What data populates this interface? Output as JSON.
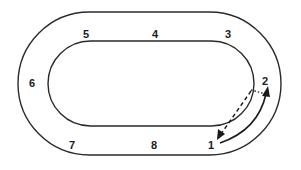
{
  "diagram": {
    "type": "oval-track",
    "colors": {
      "line": "#2a2a2a",
      "background": "#ffffff"
    },
    "track": {
      "outer": {
        "x": 18,
        "y": 12,
        "width": 263,
        "height": 143
      },
      "inner": {
        "x": 48,
        "y": 41,
        "width": 206,
        "height": 85
      }
    },
    "positions": [
      {
        "id": "1",
        "label": "1",
        "x": 208,
        "y": 149
      },
      {
        "id": "2",
        "label": "2",
        "x": 262,
        "y": 85
      },
      {
        "id": "3",
        "label": "3",
        "x": 225,
        "y": 38
      },
      {
        "id": "4",
        "label": "4",
        "x": 152,
        "y": 38
      },
      {
        "id": "5",
        "label": "5",
        "x": 83,
        "y": 38
      },
      {
        "id": "6",
        "label": "6",
        "x": 29,
        "y": 87
      },
      {
        "id": "7",
        "label": "7",
        "x": 69,
        "y": 149
      },
      {
        "id": "8",
        "label": "8",
        "x": 151,
        "y": 149
      }
    ],
    "arrows": [
      {
        "name": "solid-arrow",
        "from": "1",
        "to": "2",
        "style": "solid"
      },
      {
        "name": "dashed-arrow",
        "from": "2",
        "to": "1",
        "style": "dashed"
      },
      {
        "name": "dotted-connector",
        "from": "inner-near-2",
        "to": "2",
        "style": "dotted"
      }
    ]
  }
}
